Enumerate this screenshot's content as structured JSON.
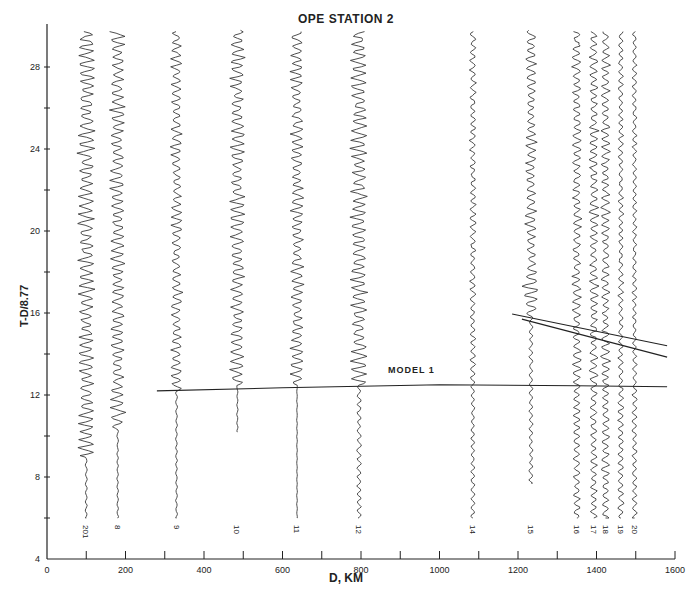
{
  "chart_data": {
    "type": "seismic-record-section",
    "title": "OPE STATION 2",
    "xlabel": "D, KM",
    "ylabel": "T-D/8.77",
    "xlim": [
      0,
      1600
    ],
    "ylim": [
      4,
      30
    ],
    "x_ticks_major": [
      0,
      200,
      400,
      600,
      800,
      1000,
      1200,
      1400,
      1600
    ],
    "x_ticks_minor": [
      100,
      300,
      500,
      700,
      900,
      1100,
      1300,
      1500
    ],
    "y_ticks_major": [
      4,
      8,
      12,
      16,
      20,
      24,
      28
    ],
    "y_ticks_minor": [
      6,
      10,
      14,
      18,
      22,
      26
    ],
    "grid": false,
    "traces": [
      {
        "label": "201",
        "distance_km": 100,
        "t_start": 6.0,
        "onset": 9.0,
        "t_end": 29.8,
        "amp": 9,
        "pre_amp": 1.0
      },
      {
        "label": "8",
        "distance_km": 180,
        "t_start": 6.0,
        "onset": 10.3,
        "t_end": 29.8,
        "amp": 8,
        "pre_amp": 0.8
      },
      {
        "label": "9",
        "distance_km": 330,
        "t_start": 6.0,
        "onset": 12.2,
        "t_end": 29.8,
        "amp": 6,
        "pre_amp": 0.9
      },
      {
        "label": "10",
        "distance_km": 485,
        "t_start": 10.2,
        "onset": 12.4,
        "t_end": 29.8,
        "amp": 8,
        "pre_amp": 0.6
      },
      {
        "label": "11",
        "distance_km": 637,
        "t_start": 6.0,
        "onset": 12.5,
        "t_end": 29.8,
        "amp": 7,
        "pre_amp": 0.3
      },
      {
        "label": "12",
        "distance_km": 795,
        "t_start": 6.0,
        "onset": 12.5,
        "t_end": 29.8,
        "amp": 9,
        "pre_amp": 2.2
      },
      {
        "label": "14",
        "distance_km": 1085,
        "t_start": 6.0,
        "onset": 12.5,
        "t_end": 29.8,
        "amp": 3.5,
        "pre_amp": 2.0
      },
      {
        "label": "15",
        "distance_km": 1233,
        "t_start": 7.7,
        "onset": 15.8,
        "t_end": 29.8,
        "amp": 6,
        "pre_amp": 2.0
      },
      {
        "label": "16",
        "distance_km": 1350,
        "t_start": 6.0,
        "onset": 12.4,
        "t_end": 29.8,
        "amp": 5,
        "pre_amp": 3.5
      },
      {
        "label": "17",
        "distance_km": 1393,
        "t_start": 6.0,
        "onset": 12.4,
        "t_end": 29.8,
        "amp": 5,
        "pre_amp": 3.5
      },
      {
        "label": "18",
        "distance_km": 1423,
        "t_start": 6.0,
        "onset": 12.4,
        "t_end": 29.8,
        "amp": 5,
        "pre_amp": 4.0
      },
      {
        "label": "19",
        "distance_km": 1462,
        "t_start": 6.0,
        "onset": 12.4,
        "t_end": 29.8,
        "amp": 3,
        "pre_amp": 3.0
      },
      {
        "label": "20",
        "distance_km": 1497,
        "t_start": 6.0,
        "onset": 12.4,
        "t_end": 29.8,
        "amp": 2.5,
        "pre_amp": 2.5
      }
    ],
    "curves": [
      {
        "name": "MODEL 1",
        "points": [
          [
            280,
            12.2
          ],
          [
            600,
            12.35
          ],
          [
            1000,
            12.5
          ],
          [
            1350,
            12.45
          ],
          [
            1580,
            12.4
          ]
        ]
      },
      {
        "name": "branch-a",
        "points": [
          [
            1185,
            15.95
          ],
          [
            1580,
            14.4
          ]
        ]
      },
      {
        "name": "branch-b",
        "points": [
          [
            1210,
            15.7
          ],
          [
            1580,
            13.85
          ]
        ]
      }
    ],
    "annotations": [
      {
        "text": "MODEL 1",
        "x_km": 870,
        "t": 12.9
      }
    ]
  },
  "labels": {
    "title": "OPE STATION 2",
    "xlabel": "D, KM",
    "ylabel": "T-D/8.77",
    "model": "MODEL 1"
  },
  "style": {
    "ink": "#222222",
    "trace": "#3a3a3a",
    "background": "#ffffff"
  }
}
